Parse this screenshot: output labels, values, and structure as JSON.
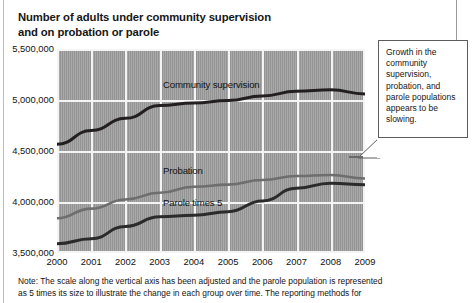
{
  "title": {
    "line1": "Number of adults under community supervision",
    "line2": "and on probation or parole"
  },
  "callout": {
    "text": "Growth in the community supervision, probation, and parole populations appears to be slowing."
  },
  "footnote": {
    "line1": "Note: The scale along the vertical axis has been adjusted and the parole population is represented",
    "line2": "as 5 times its size to illustrate the change in each group over time. The reporting methods for"
  },
  "colors": {
    "plot_background": "#9c9c9c",
    "gridline": "#f4f4f4",
    "community_supervision": "#231f20",
    "probation": "#6e6e6e",
    "parole_times_5": "#2b2b2b",
    "callout_border": "#5d5d5d"
  },
  "axis_labels": {
    "y": [
      "5,500,000",
      "5,000,000",
      "4,500,000",
      "4,000,000",
      "3,500,000"
    ],
    "x": [
      "2000",
      "2001",
      "2002",
      "2003",
      "2004",
      "2005",
      "2006",
      "2007",
      "2008",
      "2009"
    ]
  },
  "series_labels": {
    "community_supervision": "Community supervision",
    "probation": "Probation",
    "parole_times_5": "Parole times 5"
  },
  "chart_data": {
    "type": "line",
    "title": "Number of adults under community supervision and on probation or parole",
    "xlabel": "",
    "ylabel": "",
    "x": [
      2000,
      2001,
      2002,
      2003,
      2004,
      2005,
      2006,
      2007,
      2008,
      2009
    ],
    "categories": [
      "2000",
      "2001",
      "2002",
      "2003",
      "2004",
      "2005",
      "2006",
      "2007",
      "2008",
      "2009"
    ],
    "ylim": [
      3500000,
      5500000
    ],
    "yticks": [
      3500000,
      4000000,
      4500000,
      5000000,
      5500000
    ],
    "ytick_labels": [
      "3,500,000",
      "4,000,000",
      "4,500,000",
      "5,000,000",
      "5,500,000"
    ],
    "grid": true,
    "legend": "inline-labels",
    "series": [
      {
        "name": "Community supervision",
        "color": "#231f20",
        "values": [
          4565000,
          4700000,
          4820000,
          4945000,
          4970000,
          4995000,
          5040000,
          5085000,
          5100000,
          5060000
        ]
      },
      {
        "name": "Probation",
        "color": "#6e6e6e",
        "values": [
          3840000,
          3935000,
          4025000,
          4090000,
          4150000,
          4170000,
          4215000,
          4255000,
          4265000,
          4230000
        ]
      },
      {
        "name": "Parole times 5",
        "color": "#2b2b2b",
        "values": [
          3590000,
          3640000,
          3760000,
          3855000,
          3870000,
          3905000,
          4010000,
          4135000,
          4185000,
          4170000
        ]
      }
    ],
    "annotations": [
      {
        "name": "growth-slowing-callout",
        "text": "Growth in the community supervision, probation, and parole populations appears to be slowing."
      }
    ],
    "note": "Note: The scale along the vertical axis has been adjusted and the parole population is represented as 5 times its size to illustrate the change in each group over time. The reporting methods for"
  }
}
